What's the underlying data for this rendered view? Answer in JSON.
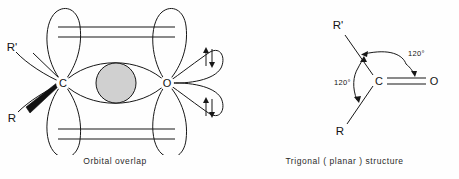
{
  "figure": {
    "background_color": "#fefefe",
    "line_color": "#171717",
    "overlap_fill_color": "#d0d0d0"
  },
  "panels": [
    {
      "id": "orbital-overlap",
      "caption": "Orbital  overlap",
      "atoms": [
        {
          "symbol": "C",
          "name": "carbon-atom"
        },
        {
          "symbol": "O",
          "name": "oxygen-atom"
        }
      ],
      "substituents": [
        {
          "label": "R'",
          "bond_style": "plain-line"
        },
        {
          "label": "R",
          "bond_style": "bold-wedge"
        }
      ],
      "features": {
        "sigma_overlap_label": "sigma overlap lens",
        "pi_bond_top_lines": 2,
        "pi_bond_bottom_lines": 2,
        "lone_pairs": 2,
        "spin_arrow_pair": "↑↓"
      }
    },
    {
      "id": "trigonal-planar",
      "caption": "Trigonal ( planar ) structure",
      "atoms": [
        {
          "symbol": "C",
          "name": "carbon-atom"
        },
        {
          "symbol": "O",
          "name": "oxygen-atom"
        }
      ],
      "substituents": [
        {
          "label": "R'",
          "position": "upper-left"
        },
        {
          "label": "R",
          "position": "lower-left"
        }
      ],
      "bonds": [
        {
          "from": "C",
          "to": "O",
          "order": 2,
          "name": "carbonyl-double-bond"
        },
        {
          "from": "C",
          "to": "R'",
          "order": 1
        },
        {
          "from": "C",
          "to": "R",
          "order": 1
        }
      ],
      "angles": [
        {
          "value": "120°",
          "name": "angle-upper"
        },
        {
          "value": "120°",
          "name": "angle-lower"
        }
      ]
    }
  ]
}
